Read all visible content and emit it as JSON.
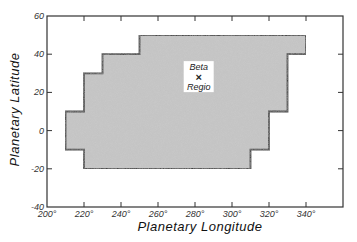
{
  "chart_data": {
    "type": "area",
    "title": "",
    "xlabel": "Planetary Longitude",
    "ylabel": "Planetary Latitude",
    "xlim": [
      200,
      360
    ],
    "ylim": [
      -40,
      60
    ],
    "xticks": [
      200,
      220,
      240,
      260,
      280,
      300,
      320,
      340
    ],
    "xtick_labels": [
      "200°",
      "220°",
      "240°",
      "260°",
      "280°",
      "300°",
      "320°",
      "340°"
    ],
    "yticks": [
      60,
      40,
      20,
      0,
      -20,
      -40
    ],
    "ytick_labels": [
      "60",
      "40",
      "20",
      "0",
      "-20",
      "-40"
    ],
    "grid": false,
    "region": {
      "name": "coverage-region",
      "fill": "#c9c9c9",
      "stroke": "#222222",
      "vertices": [
        [
          250,
          50
        ],
        [
          340,
          50
        ],
        [
          340,
          40
        ],
        [
          330,
          40
        ],
        [
          330,
          10
        ],
        [
          320,
          10
        ],
        [
          320,
          -10
        ],
        [
          310,
          -10
        ],
        [
          310,
          -20
        ],
        [
          220,
          -20
        ],
        [
          220,
          -10
        ],
        [
          210,
          -10
        ],
        [
          210,
          10
        ],
        [
          220,
          10
        ],
        [
          220,
          30
        ],
        [
          230,
          30
        ],
        [
          230,
          40
        ],
        [
          250,
          40
        ]
      ]
    },
    "annotations": [
      {
        "marker": "×",
        "lon": 282,
        "lat": 28,
        "label_top": "Beta",
        "label_bottom": "Regio"
      }
    ]
  }
}
